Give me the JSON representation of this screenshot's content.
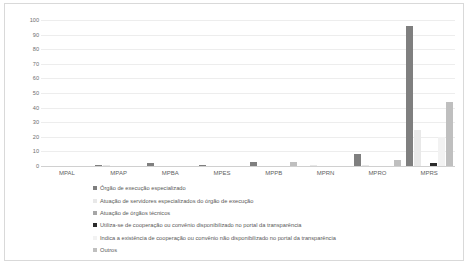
{
  "chart_data": {
    "type": "bar",
    "title": "",
    "xlabel": "",
    "ylabel": "",
    "ylim": [
      0,
      100
    ],
    "ytick_step": 10,
    "grid": true,
    "legend_position": "bottom",
    "categories": [
      "MPAL",
      "MPAP",
      "MPBA",
      "MPES",
      "MPPB",
      "MPRN",
      "MPRO",
      "MPRS"
    ],
    "yticks": [
      "100",
      "90",
      "80",
      "70",
      "60",
      "50",
      "40",
      "30",
      "20",
      "10",
      "0"
    ],
    "series": [
      {
        "name": "Órgão de execução especializado",
        "color": "#7f7f7f",
        "values": [
          0,
          1,
          2,
          1,
          3,
          0,
          8,
          96
        ]
      },
      {
        "name": "Atuação de servidores especializados do órgão de execução",
        "color": "#e8e8e8",
        "values": [
          0,
          1,
          0,
          0,
          0,
          1,
          1,
          25
        ]
      },
      {
        "name": "Atuação de órgãos técnicos",
        "color": "#a6a6a6",
        "values": [
          0,
          0,
          0,
          0,
          0,
          0,
          0,
          0
        ]
      },
      {
        "name": "Utiliza-se de cooperação ou convênio disponibilizado no portal da transparência",
        "color": "#2b2b2b",
        "values": [
          0,
          0,
          0,
          0,
          0,
          0,
          0,
          2
        ]
      },
      {
        "name": "Indica a existência de cooperação ou convênio não disponibilizado no portal da transparência",
        "color": "#f2f2f2",
        "values": [
          0,
          0,
          0,
          0,
          0,
          0,
          0,
          20
        ]
      },
      {
        "name": "Outros",
        "color": "#bfbfbf",
        "values": [
          0,
          0,
          0,
          0,
          3,
          0,
          4,
          44
        ]
      }
    ]
  }
}
